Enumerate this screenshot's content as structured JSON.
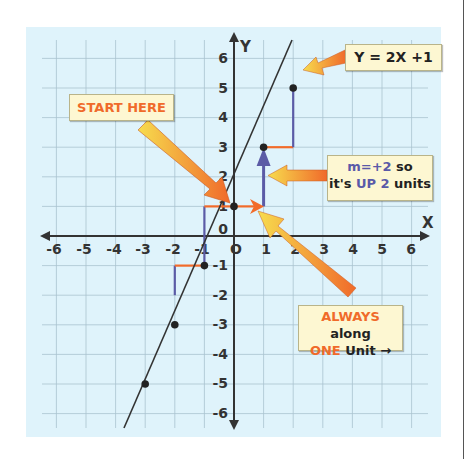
{
  "diagram": {
    "equation_label": "Y = 2X +1",
    "axis_x_label": "X",
    "axis_y_label": "Y",
    "x_ticks": [
      "-6",
      "-5",
      "-4",
      "-3",
      "-2",
      "-1",
      "0",
      "1",
      "2",
      "3",
      "4",
      "5",
      "6"
    ],
    "y_ticks": [
      "6",
      "5",
      "4",
      "3",
      "2",
      "1",
      "0",
      "-1",
      "-2",
      "-3",
      "-4",
      "-5",
      "-6"
    ],
    "callouts": {
      "start": "START HERE",
      "slope_line1_a": "m=+2",
      "slope_line1_b": " so",
      "slope_line2_a": "it's ",
      "slope_line2_b": "UP 2",
      "slope_line2_c": " units",
      "along_line1_a": "ALWAYS",
      "along_line1_b": " along",
      "along_line2_a": "ONE",
      "along_line2_b": " Unit →"
    },
    "points": [
      [
        -3,
        -5
      ],
      [
        -2,
        -3
      ],
      [
        -1,
        -1
      ],
      [
        0,
        1
      ],
      [
        1,
        3
      ],
      [
        2,
        5
      ]
    ],
    "colors": {
      "background": "#dff3fb",
      "grid": "#a9c3cf",
      "axis": "#333333",
      "run_segment": "#f26b2a",
      "rise_segment": "#5b5ba6",
      "callout_bg": "#fdf7d2",
      "arrow_orange": "#f06a2a",
      "arrow_yellow": "#f7d94a"
    }
  }
}
